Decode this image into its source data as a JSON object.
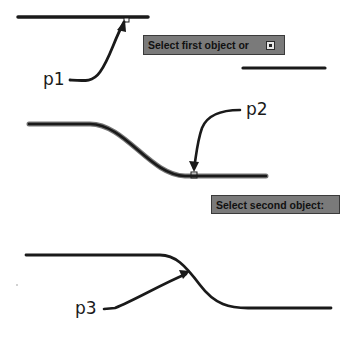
{
  "labels": {
    "p1": "p1",
    "p2": "p2",
    "p3": "p3"
  },
  "prompts": {
    "first": "Select first object or",
    "second": "Select second object:"
  },
  "icons": {
    "first_prompt_options": "down-arrow-options-icon"
  },
  "colors": {
    "line": "#1a1a1a",
    "tooltip_bg": "#7a7a7a",
    "tooltip_border": "#3a3a3a",
    "background": "#ffffff"
  }
}
